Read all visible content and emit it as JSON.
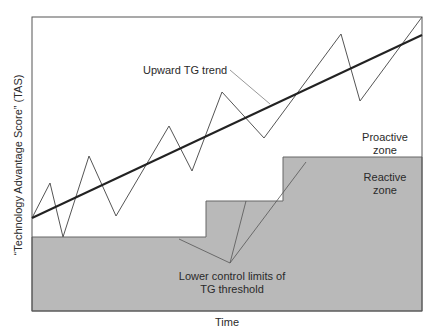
{
  "diagram": {
    "title": "",
    "x_axis_label": "Time",
    "y_axis_label": "“Technology Advantage Score” (TAS)",
    "annotations": {
      "trend": "Upward TG trend",
      "lower_limits_line1": "Lower control limits of",
      "lower_limits_line2": "TG threshold",
      "proactive_line1": "Proactive",
      "proactive_line2": "zone",
      "reactive_line1": "Reactive",
      "reactive_line2": "zone"
    },
    "colors": {
      "frame": "#555555",
      "reactive_fill": "#b9b9b9",
      "trend_line": "#222222",
      "zigzag_line": "#555555",
      "callout_line": "#666666"
    },
    "frame": {
      "x": 32,
      "y": 17,
      "width": 390,
      "height": 294
    },
    "zigzag_points": "32,218 50,183 63,237 89,156 116,216 169,126 192,171 222,92 264,138 341,34 360,101 422,17",
    "trend_points": "32,218 422,35",
    "threshold_polygon": "32,311 32,237 206,237 206,201 283,201 283,157 422,157 422,311",
    "threshold_steps": [
      {
        "x_start": 32,
        "x_end": 206,
        "y": 237
      },
      {
        "x_start": 206,
        "x_end": 283,
        "y": 201
      },
      {
        "x_start": 283,
        "x_end": 422,
        "y": 157
      }
    ],
    "trend_callout": "230,70 270,104",
    "limits_callouts": [
      "230,263 179,239",
      "230,263 246,201",
      "230,263 306,162"
    ]
  }
}
